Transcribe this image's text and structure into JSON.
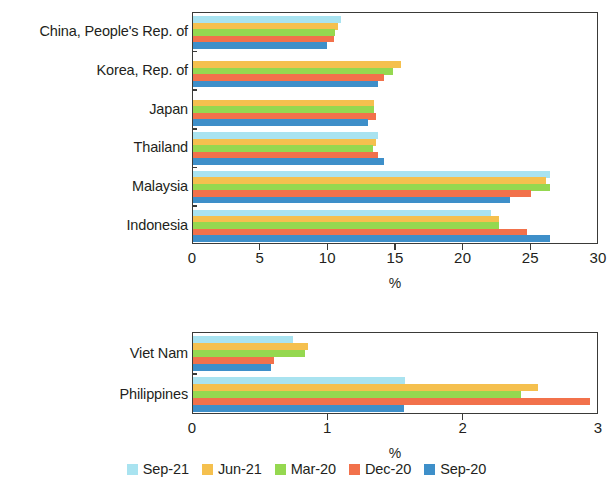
{
  "chart_data": [
    {
      "type": "bar",
      "orientation": "horizontal",
      "panel": "top",
      "title": "",
      "xlabel": "%",
      "ylabel": "",
      "xlim": [
        0,
        30
      ],
      "xticks": [
        0,
        5,
        10,
        15,
        20,
        25,
        30
      ],
      "xtick_labels": [
        "0",
        "5",
        "10",
        "15",
        "20",
        "25",
        "30"
      ],
      "grid": false,
      "legend_position": "bottom",
      "categories": [
        "China, People's Rep. of",
        "Korea, Rep. of",
        "Japan",
        "Thailand",
        "Malaysia",
        "Indonesia"
      ],
      "series": [
        {
          "name": "Sep-21",
          "color": "#a9e3f0",
          "values": [
            10.9,
            null,
            null,
            13.7,
            26.4,
            22.0
          ]
        },
        {
          "name": "Jun-21",
          "color": "#f5c04e",
          "values": [
            10.7,
            15.4,
            13.4,
            13.5,
            26.1,
            22.6
          ]
        },
        {
          "name": "Mar-20",
          "color": "#95d850",
          "values": [
            10.5,
            14.8,
            13.4,
            13.3,
            26.4,
            22.6
          ]
        },
        {
          "name": "Dec-20",
          "color": "#f2714b",
          "values": [
            10.4,
            14.1,
            13.5,
            13.7,
            25.0,
            24.7
          ]
        },
        {
          "name": "Sep-20",
          "color": "#3e8fc9",
          "values": [
            9.9,
            13.7,
            12.9,
            14.1,
            23.4,
            26.4
          ]
        }
      ]
    },
    {
      "type": "bar",
      "orientation": "horizontal",
      "panel": "bottom",
      "title": "",
      "xlabel": "%",
      "ylabel": "",
      "xlim": [
        0,
        3
      ],
      "xticks": [
        0,
        1,
        2,
        3
      ],
      "xtick_labels": [
        "0",
        "1",
        "2",
        "3"
      ],
      "grid": false,
      "legend_position": "bottom",
      "categories": [
        "Viet Nam",
        "Philippines"
      ],
      "series": [
        {
          "name": "Sep-21",
          "color": "#a9e3f0",
          "values": [
            0.74,
            1.57
          ]
        },
        {
          "name": "Jun-21",
          "color": "#f5c04e",
          "values": [
            0.85,
            2.55
          ]
        },
        {
          "name": "Mar-20",
          "color": "#95d850",
          "values": [
            0.83,
            2.42
          ]
        },
        {
          "name": "Dec-20",
          "color": "#f2714b",
          "values": [
            0.6,
            2.93
          ]
        },
        {
          "name": "Sep-20",
          "color": "#3e8fc9",
          "values": [
            0.58,
            1.56
          ]
        }
      ]
    }
  ],
  "legend": {
    "items": [
      {
        "label": "Sep-21",
        "color": "#a9e3f0"
      },
      {
        "label": "Jun-21",
        "color": "#f5c04e"
      },
      {
        "label": "Mar-20",
        "color": "#95d850"
      },
      {
        "label": "Dec-20",
        "color": "#f2714b"
      },
      {
        "label": "Sep-20",
        "color": "#3e8fc9"
      }
    ]
  },
  "layout": {
    "top_panel": {
      "plot_left": 192,
      "plot_top": 12,
      "plot_width": 406,
      "plot_height": 232,
      "xaxis_label_y": 276,
      "tick_label_y": 250
    },
    "bottom_panel": {
      "plot_left": 192,
      "plot_top": 332,
      "plot_width": 406,
      "plot_height": 82,
      "xaxis_label_y": 446,
      "tick_label_y": 420
    },
    "legend_y": 462
  }
}
